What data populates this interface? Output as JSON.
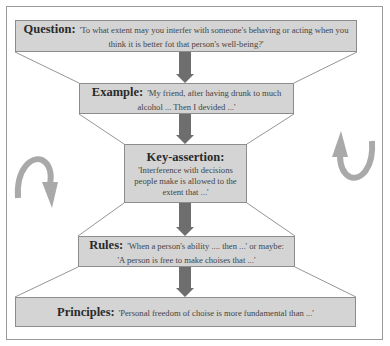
{
  "diagram": {
    "colors": {
      "box_fill": "#d4d4d4",
      "box_border": "#8c8c8c",
      "arrow": "#6e6e6e",
      "curved_arrow": "#a9a9a9",
      "frame": "#9a9a9a"
    },
    "levels": [
      {
        "label": "Question:",
        "text": "'To what extent may you interfer with someone's behaving or acting when you think it is better fot that person's well-being?'"
      },
      {
        "label": "Example:",
        "text": "'My friend, after having drunk to much alcohol ... Then I devided ...'"
      },
      {
        "label": "Key-assertion:",
        "text": "'Interference with decisions people make is allowed to the extent that ...'"
      },
      {
        "label": "Rules:",
        "text": "'When a person's ability .... then ...' or maybe: 'A person is free to make choises that ...'"
      },
      {
        "label": "Principles:",
        "text": "'Personal freedom of choise is more fundamental than ...'"
      }
    ],
    "side_arrows": {
      "left": "curved-arrow-down-clockwise",
      "right": "curved-arrow-up-counterclockwise"
    }
  }
}
